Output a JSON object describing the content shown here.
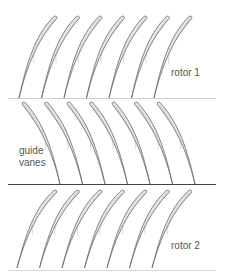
{
  "diagram": {
    "title": "",
    "colors": {
      "background": "#ffffff",
      "blade_fill": "#e4e4e4",
      "blade_stroke": "#6a6a6a",
      "line_light": "#cfcfcf",
      "line_dark": "#444444",
      "label": "#555555"
    },
    "lines": [
      {
        "id": "rotor1-bottom",
        "y": 98,
        "x1": 8,
        "x2": 216,
        "color": "#cfcfcf",
        "width": 1
      },
      {
        "id": "guide-vanes-bottom",
        "y": 184,
        "x1": 8,
        "x2": 216,
        "color": "#444444",
        "width": 1
      },
      {
        "id": "rotor2-bottom",
        "y": 270,
        "x1": 8,
        "x2": 216,
        "color": "#d8d8d8",
        "width": 1
      }
    ],
    "rows": [
      {
        "name": "rotor 1",
        "label": "rotor 1",
        "label_pos": {
          "x": 171,
          "y": 67
        },
        "kind": "rotor",
        "count": 7,
        "top_y": 14,
        "bottom_y": 98,
        "top_x_start": 56,
        "bottom_x_start": 19,
        "pitch": 22.5
      },
      {
        "name": "guide vanes",
        "label": "guide\nvanes",
        "label_lines": [
          "guide",
          "vanes"
        ],
        "label_pos": {
          "x": 19,
          "y": 145
        },
        "kind": "vane",
        "count": 7,
        "top_y": 100,
        "bottom_y": 184,
        "top_x_start": 23,
        "bottom_x_start": 60,
        "pitch": 22.5
      },
      {
        "name": "rotor 2",
        "label": "rotor 2",
        "label_pos": {
          "x": 171,
          "y": 240
        },
        "kind": "rotor",
        "count": 7,
        "top_y": 188,
        "bottom_y": 268,
        "top_x_start": 56,
        "bottom_x_start": 17,
        "pitch": 22.5
      }
    ]
  }
}
